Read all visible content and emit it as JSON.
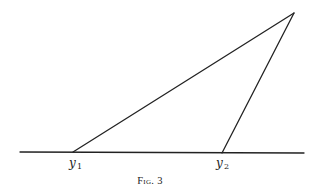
{
  "figure": {
    "caption": "Fig. 3",
    "labels": {
      "vertex_1": {
        "base": "y",
        "subscript": "1"
      },
      "vertex_2": {
        "base": "y",
        "subscript": "2"
      }
    },
    "elements": {
      "baseline": "horizontal base line",
      "triangle": "triangle with vertices y1, y2 on base line and apex above right"
    },
    "colors": {
      "ink": "#222222",
      "background": "#ffffff"
    }
  }
}
